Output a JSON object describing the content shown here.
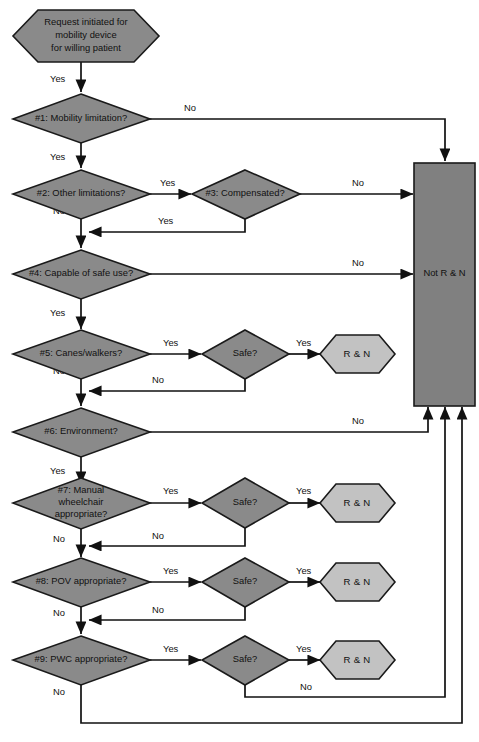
{
  "diagram": {
    "colors": {
      "decision_fill": "#8a8a8a",
      "terminal_fill": "#c2c2c2",
      "reject_fill": "#808080",
      "stroke": "#111111",
      "background": "#ffffff"
    },
    "nodes": {
      "start": {
        "label_line1": "Request initiated for",
        "label_line2": "mobility device",
        "label_line3": "for willing patient",
        "shape": "hexagon"
      },
      "q1": {
        "label": "#1: Mobility limitation?",
        "shape": "diamond"
      },
      "q2": {
        "label": "#2: Other limitations?",
        "shape": "diamond"
      },
      "q3": {
        "label": "#3: Compensated?",
        "shape": "diamond"
      },
      "q4": {
        "label": "#4: Capable of safe use?",
        "shape": "diamond"
      },
      "q5": {
        "label": "#5: Canes/walkers?",
        "shape": "diamond"
      },
      "q5_safe": {
        "label": "Safe?",
        "shape": "diamond"
      },
      "q6": {
        "label": "#6: Environment?",
        "shape": "diamond"
      },
      "q7": {
        "label_line1": "#7: Manual",
        "label_line2": "wheelchair",
        "label_line3": "appropriate?",
        "shape": "diamond"
      },
      "q7_safe": {
        "label": "Safe?",
        "shape": "diamond"
      },
      "q8": {
        "label": "#8: POV appropriate?",
        "shape": "diamond"
      },
      "q8_safe": {
        "label": "Safe?",
        "shape": "diamond"
      },
      "q9": {
        "label": "#9: PWC appropriate?",
        "shape": "diamond"
      },
      "q9_safe": {
        "label": "Safe?",
        "shape": "diamond"
      },
      "not_rn": {
        "label": "Not R & N",
        "shape": "rectangle"
      },
      "rn_5": {
        "label": "R & N",
        "shape": "hexagon"
      },
      "rn_7": {
        "label": "R & N",
        "shape": "hexagon"
      },
      "rn_8": {
        "label": "R & N",
        "shape": "hexagon"
      },
      "rn_9": {
        "label": "R & N",
        "shape": "hexagon"
      }
    },
    "edge_labels": {
      "start_yes": "Yes",
      "q1_no": "No",
      "q1_yes": "Yes",
      "q2_yes": "Yes",
      "q2_no": "No",
      "q3_no": "No",
      "q3_yes": "Yes",
      "q4_no": "No",
      "q4_yes": "Yes",
      "q5_yes": "Yes",
      "q5_no": "No",
      "q5safe_yes": "Yes",
      "q5safe_no": "No",
      "q6_no": "No",
      "q6_yes": "Yes",
      "q7_yes": "Yes",
      "q7_no": "No",
      "q7safe_yes": "Yes",
      "q7safe_no": "No",
      "q8_yes": "Yes",
      "q8_no": "No",
      "q8safe_yes": "Yes",
      "q8safe_no": "No",
      "q9_yes": "Yes",
      "q9_no": "No",
      "q9safe_yes": "Yes",
      "q9safe_no": "No"
    }
  }
}
